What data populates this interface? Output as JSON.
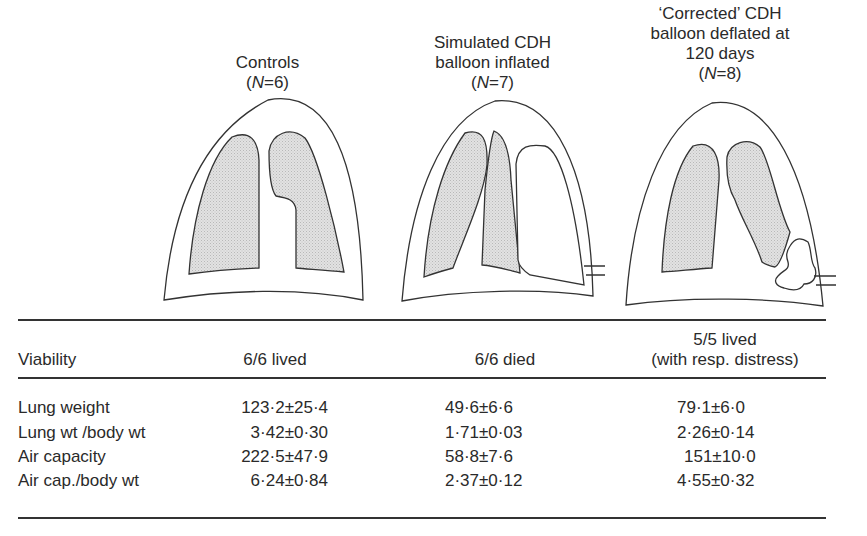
{
  "groups": [
    {
      "title_lines": [
        "Controls"
      ],
      "n_label": "6",
      "viability": [
        "6/6 lived"
      ],
      "diagram": "normal-lungs"
    },
    {
      "title_lines": [
        "Simulated CDH",
        "balloon inflated"
      ],
      "n_label": "7",
      "viability": [
        "6/6 died"
      ],
      "diagram": "left-lung-compressed-by-inflated-balloon"
    },
    {
      "title_lines": [
        "‘Corrected’ CDH",
        "balloon deflated at",
        "120 days"
      ],
      "n_label": "8",
      "viability": [
        "5/5 lived",
        "(with resp. distress)"
      ],
      "diagram": "lungs-with-deflated-balloon"
    }
  ],
  "n_prefix": "(",
  "n_var": "N",
  "n_eq": "=",
  "n_suffix": ")",
  "table": {
    "viability_label": "Viability",
    "rows": [
      {
        "label": "Lung weight",
        "values": [
          "123·2±25·4",
          "49·6±6·6",
          "79·1±6·0"
        ]
      },
      {
        "label": "Lung wt /body wt",
        "values": [
          "3·42±0·30",
          "1·71±0·03",
          "2·26±0·14"
        ]
      },
      {
        "label": "Air capacity",
        "values": [
          "222·5±47·9",
          "58·8±7·6",
          "151±10·0"
        ]
      },
      {
        "label": "Air cap./body wt",
        "values": [
          "6·24±0·84",
          "2·37±0·12",
          "4·55±0·32"
        ]
      }
    ]
  },
  "colors": {
    "line": "#333333",
    "lung_fill": "#d9d9d9"
  }
}
